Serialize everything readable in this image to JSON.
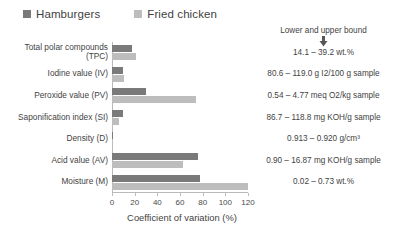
{
  "legend": {
    "items": [
      {
        "label": "Hamburgers",
        "color": "#7a7a7a"
      },
      {
        "label": "Fried chicken",
        "color": "#bdbdbd"
      }
    ]
  },
  "bounds_header": "Lower and upper bound",
  "arrow_icon": "⬇",
  "chart_data": {
    "type": "bar",
    "orientation": "horizontal",
    "title": "",
    "xlabel": "Coefficient of variation (%)",
    "ylabel": "",
    "xlim": [
      0,
      120
    ],
    "xticks": [
      0,
      20,
      40,
      60,
      80,
      100,
      120
    ],
    "grid": false,
    "legend_position": "top-left",
    "categories": [
      "Total polar compounds\n(TPC)",
      "Iodine value (IV)",
      "Peroxide value (PV)",
      "Saponification index (SI)",
      "Density (D)",
      "Acid value (AV)",
      "Moisture (M)"
    ],
    "series": [
      {
        "name": "Hamburgers",
        "color": "#7a7a7a",
        "values": [
          18.0,
          10.0,
          30.0,
          10.0,
          0.4,
          76.0,
          78.0
        ]
      },
      {
        "name": "Fried chicken",
        "color": "#bdbdbd",
        "values": [
          21.0,
          11.0,
          74.0,
          6.0,
          0.3,
          63.0,
          120.0
        ]
      }
    ],
    "annotations": [
      "14.1 – 39.2 wt.%",
      "80.6 – 119.0 g I2/100 g sample",
      "0.54 – 4.77 meq O2/kg sample",
      "86.7 – 118.8 mg KOH/g sample",
      "0.913 – 0.920 g/cm³",
      "0.90 – 16.87 mg KOH/g sample",
      "0.02 – 0.73 wt.%"
    ]
  }
}
